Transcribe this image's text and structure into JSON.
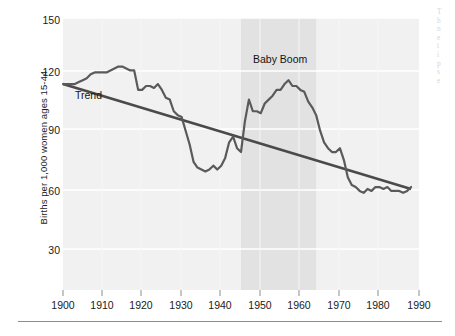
{
  "chart_data": {
    "type": "line",
    "title": "",
    "xlabel": "",
    "ylabel": "Births per 1,000 women ages 15-44",
    "xlim": [
      1900,
      1990
    ],
    "ylim": [
      15,
      155
    ],
    "grid": true,
    "legend_position": "none",
    "xticks": [
      1900,
      1910,
      1920,
      1930,
      1940,
      1950,
      1960,
      1970,
      1980,
      1990
    ],
    "yticks": [
      30,
      60,
      90,
      120,
      150
    ],
    "annotations": [
      {
        "text": "Trend",
        "x": 1903,
        "y": 104
      },
      {
        "text": "Baby Boom",
        "x": 1954,
        "y": 132
      }
    ],
    "shaded_band": {
      "label": "Baby Boom period",
      "x0": 1945,
      "x1": 1964,
      "color": "#e2e2e2"
    },
    "series": [
      {
        "name": "Birth rate",
        "color": "#5a5a5a",
        "x": [
          1900,
          1901,
          1902,
          1903,
          1904,
          1905,
          1906,
          1907,
          1908,
          1909,
          1910,
          1911,
          1912,
          1913,
          1914,
          1915,
          1916,
          1917,
          1918,
          1919,
          1920,
          1921,
          1922,
          1923,
          1924,
          1925,
          1926,
          1927,
          1928,
          1929,
          1930,
          1931,
          1932,
          1933,
          1934,
          1935,
          1936,
          1937,
          1938,
          1939,
          1940,
          1941,
          1942,
          1943,
          1944,
          1945,
          1946,
          1947,
          1948,
          1949,
          1950,
          1951,
          1952,
          1953,
          1954,
          1955,
          1956,
          1957,
          1958,
          1959,
          1960,
          1961,
          1962,
          1963,
          1964,
          1965,
          1966,
          1967,
          1968,
          1969,
          1970,
          1971,
          1972,
          1973,
          1974,
          1975,
          1976,
          1977,
          1978,
          1979,
          1980,
          1981,
          1982,
          1983,
          1984,
          1985,
          1986,
          1987,
          1988
        ],
        "values": [
          121,
          121,
          121,
          121,
          122,
          123,
          124,
          126,
          127,
          127,
          127,
          127,
          128,
          129,
          130,
          130,
          129,
          128,
          128,
          118,
          118,
          120,
          120,
          119,
          121,
          118,
          114,
          113,
          107,
          105,
          104,
          97,
          90,
          81,
          78,
          77,
          76,
          77,
          79,
          77,
          79,
          83,
          91,
          94,
          88,
          86,
          102,
          113,
          107,
          107,
          106,
          111,
          113,
          115,
          118,
          118,
          121,
          123,
          120,
          120,
          118,
          117,
          112,
          109,
          105,
          97,
          91,
          88,
          86,
          86,
          88,
          82,
          73,
          69,
          68,
          66,
          65,
          67,
          66,
          68,
          68,
          67,
          68,
          66,
          66,
          66,
          65,
          66,
          68
        ]
      },
      {
        "name": "Trend",
        "color": "#4a4a4a",
        "x": [
          1900,
          1988
        ],
        "values": [
          121,
          67
        ]
      }
    ]
  },
  "margin_text": {
    "lines": [
      "T",
      "h",
      "n",
      "e",
      "t",
      "i",
      "p",
      "s",
      "e"
    ]
  }
}
